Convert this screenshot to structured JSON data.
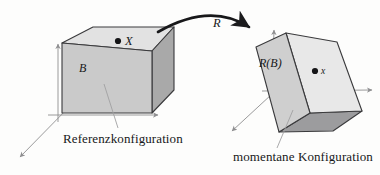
{
  "figure": {
    "background_color": "#fdfdfc",
    "ink_color": "#17181a",
    "axis_color": "#8e8e90"
  },
  "labels": {
    "reference_body": "B",
    "reference_point": "X",
    "map": "R",
    "current_body": "R(B)",
    "current_point": "x",
    "reference_caption": "Referenzkonfiguration",
    "current_caption": "momentane Konfiguration"
  },
  "shapes": {
    "reference_box": {
      "name": "reference-configuration-box",
      "faces": {
        "top": {
          "fill": "#e2e2e2",
          "points": "62,43 93,27 174,27 152,51"
        },
        "front": {
          "fill": "#cacaca",
          "points": "62,43 152,51 152,113 62,113"
        },
        "right": {
          "fill": "#a9a9a9",
          "points": "152,51 174,27 174,90 152,113"
        }
      },
      "edge_color": "#3a3a3c",
      "edge_width": 1.1
    },
    "current_box": {
      "name": "current-configuration-box",
      "faces": {
        "front": {
          "fill": "#cfcfcf",
          "points": "256,47 286,33 310,113 279,132"
        },
        "top": {
          "fill": "#e4e4e4",
          "points": "286,33 309,40 337,42 310,113"
        },
        "right_light": {
          "fill": "#e8e8e8",
          "points": "286,33 337,42 362,111 310,113"
        },
        "bottom": {
          "fill": "#9c9c9e",
          "points": "279,132 310,113 362,111 333,131"
        }
      },
      "edge_color": "#3a3a3c",
      "edge_width": 1.1
    }
  },
  "axes": {
    "reference": {
      "origin": [
        58,
        118
      ],
      "vertical_tip": [
        58,
        42
      ],
      "horizontal_tip": [
        161,
        115
      ],
      "oblique_tip": [
        17,
        160
      ]
    },
    "current": {
      "origin": [
        272,
        93
      ],
      "vertical_tip": [
        274,
        28
      ],
      "horizontal_tip": [
        375,
        90
      ],
      "oblique_tip": [
        230,
        133
      ]
    }
  },
  "arrow": {
    "name": "rotation-arc-arrow",
    "path": "M 158,32 Q 214,3 252,29",
    "head": "252,29 241,23 244,33"
  },
  "leaders": {
    "reference": "M 118,128 L 104,84",
    "current": "M 277,148 L 293,110"
  },
  "points": [
    {
      "name": "material-point-X",
      "cx": 118,
      "cy": 41,
      "r": 3.1
    },
    {
      "name": "spatial-point-x",
      "cx": 315,
      "cy": 71,
      "r": 3.1
    }
  ]
}
